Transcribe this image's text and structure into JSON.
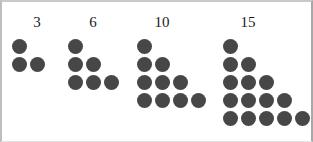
{
  "figure": {
    "title": "",
    "background_color": "#ffffff",
    "border_color": "#bdbdbd",
    "dot_color": "#474747",
    "label_color": "#1a1a1a",
    "width": 313,
    "height": 142
  },
  "chart_data": {
    "type": "scatter",
    "title": "",
    "subtitle": "",
    "xlabel": "",
    "ylabel": "",
    "grid": false,
    "legend": "none",
    "categories": [
      "3",
      "6",
      "10",
      "15"
    ],
    "values": [
      3,
      6,
      10,
      15
    ],
    "series": [
      {
        "name": "triangular numbers",
        "values": [
          3,
          6,
          10,
          15
        ]
      }
    ],
    "groups": [
      {
        "label": "3",
        "total": 3,
        "rows": 2,
        "row_counts": [
          1,
          2
        ],
        "origin_x": 10,
        "label_x": 10,
        "label_width": 50
      },
      {
        "label": "6",
        "total": 6,
        "rows": 3,
        "row_counts": [
          1,
          2,
          3
        ],
        "origin_x": 66,
        "label_x": 66,
        "label_width": 50
      },
      {
        "label": "10",
        "total": 10,
        "rows": 4,
        "row_counts": [
          1,
          2,
          3,
          4
        ],
        "origin_x": 135,
        "label_x": 135,
        "label_width": 50
      },
      {
        "label": "15",
        "total": 15,
        "rows": 5,
        "row_counts": [
          1,
          2,
          3,
          4,
          5
        ],
        "origin_x": 221,
        "label_x": 221,
        "label_width": 50
      }
    ],
    "dot_geometry": {
      "diameter": 15,
      "step_x": 18,
      "step_y": 18,
      "first_row_y": 37
    }
  }
}
